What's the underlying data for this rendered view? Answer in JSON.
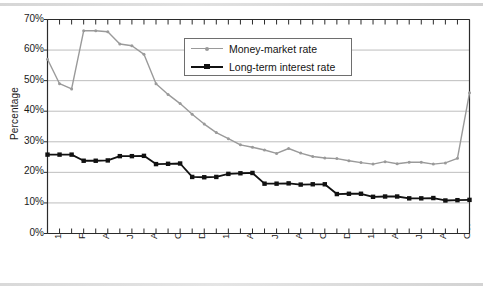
{
  "chart_data": {
    "type": "line",
    "title": "",
    "xlabel": "",
    "ylabel": "Percentage",
    "ylim": [
      0,
      70
    ],
    "ytick_labels": [
      "0%",
      "10%",
      "20%",
      "30%",
      "40%",
      "50%",
      "60%",
      "70%"
    ],
    "ytick_values": [
      0,
      10,
      20,
      30,
      40,
      50,
      60,
      70
    ],
    "grid": "horizontal",
    "legend_position": "top-center",
    "x": [
      "1994 Dec",
      "1995 Jan",
      "Feb",
      "Mar",
      "Apr",
      "May",
      "Jun",
      "Jul",
      "Aug",
      "Sep",
      "Oct",
      "Nov",
      "Dec",
      "1995 Feb-a",
      "Feb",
      "Mar",
      "Apr",
      "May",
      "Jun",
      "Jul",
      "Aug",
      "Sep",
      "Oct",
      "Nov",
      "Dec",
      "1996 Jan",
      "Feb",
      "Mar",
      "Apr",
      "May",
      "Jun",
      "Jul",
      "Aug",
      "Sep",
      "Oct",
      "Nov"
    ],
    "xtick_labels": [
      {
        "index": 0,
        "label": "1994 Dec"
      },
      {
        "index": 2,
        "label": "Feb"
      },
      {
        "index": 4,
        "label": "Apr"
      },
      {
        "index": 6,
        "label": "Jun"
      },
      {
        "index": 8,
        "label": "Aug"
      },
      {
        "index": 10,
        "label": "Oct"
      },
      {
        "index": 12,
        "label": "Dec"
      },
      {
        "index": 14,
        "label": "1995 Feb"
      },
      {
        "index": 16,
        "label": "Apr"
      },
      {
        "index": 18,
        "label": "Jun"
      },
      {
        "index": 20,
        "label": "Aug"
      },
      {
        "index": 22,
        "label": "Oct"
      },
      {
        "index": 24,
        "label": "Dec"
      },
      {
        "index": 26,
        "label": "1996 Feb"
      },
      {
        "index": 28,
        "label": "Apr"
      },
      {
        "index": 30,
        "label": "Jun"
      },
      {
        "index": 32,
        "label": "Aug"
      },
      {
        "index": 34,
        "label": "Oct"
      }
    ],
    "series": [
      {
        "name": "Money-market rate",
        "color": "#9a9a9a",
        "marker": "dot",
        "values": [
          57.0,
          49.0,
          47.3,
          66.3,
          66.3,
          66.0,
          62.0,
          61.4,
          58.6,
          49.0,
          45.5,
          42.5,
          39.0,
          35.8,
          33.0,
          31.0,
          29.0,
          28.2,
          27.3,
          26.2,
          27.8,
          26.3,
          25.2,
          24.7,
          24.5,
          23.8,
          23.2,
          22.7,
          23.5,
          22.8,
          23.3,
          23.3,
          22.7,
          23.1,
          24.6,
          46.0
        ]
      },
      {
        "name": "Long-term interest rate",
        "color": "#111111",
        "marker": "square",
        "values": [
          25.8,
          25.8,
          25.8,
          23.8,
          23.8,
          23.9,
          25.3,
          25.3,
          25.4,
          22.7,
          22.8,
          22.9,
          18.5,
          18.4,
          18.5,
          19.5,
          19.7,
          19.8,
          16.3,
          16.3,
          16.4,
          16.0,
          16.1,
          16.1,
          12.9,
          13.0,
          13.0,
          12.0,
          12.1,
          12.1,
          11.5,
          11.5,
          11.6,
          10.8,
          10.9,
          11.0
        ]
      }
    ]
  },
  "legend": {
    "items": [
      {
        "label": "Money-market rate",
        "color": "#9a9a9a",
        "marker": "dot"
      },
      {
        "label": "Long-term interest rate",
        "color": "#111111",
        "marker": "square"
      }
    ]
  },
  "axis": {
    "y_title": "Percentage"
  },
  "colors": {
    "money_market": "#9a9a9a",
    "long_term": "#111111",
    "grid": "#b7b7b7",
    "axis": "#2b2b2b",
    "background": "#ffffff"
  }
}
